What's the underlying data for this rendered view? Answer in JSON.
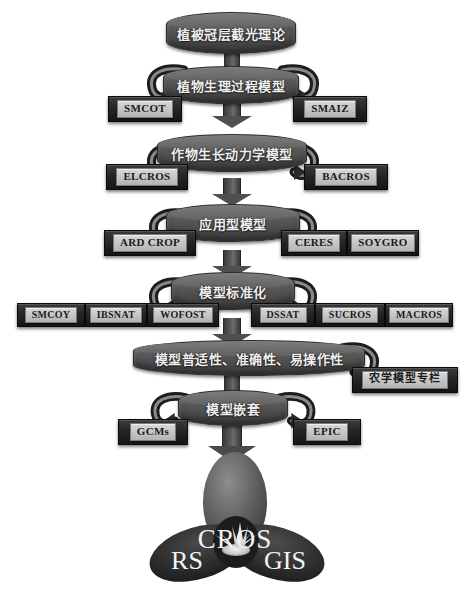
{
  "diagram": {
    "title_flow": "Crop model development flowchart",
    "background_color": "#ffffff",
    "node_color": "#5a5a5a",
    "box_color": "#1e1e1e",
    "label_text_color": "#1b1b1b"
  },
  "levels": [
    {
      "id": "level-1",
      "node": "植被冠层截光理论",
      "left_boxes": [],
      "right_boxes": []
    },
    {
      "id": "level-2",
      "node": "植物生理过程模型",
      "left_boxes": [
        "SMCOT"
      ],
      "right_boxes": [
        "SMAIZ"
      ]
    },
    {
      "id": "level-3",
      "node": "作物生长动力学模型",
      "left_boxes": [
        "ELCROS"
      ],
      "right_boxes": [
        "BACROS"
      ]
    },
    {
      "id": "level-4",
      "node": "应用型模型",
      "left_boxes": [
        "ARD CROP"
      ],
      "right_boxes": [
        "CERES",
        "SOYGRO"
      ]
    },
    {
      "id": "level-5",
      "node": "模型标准化",
      "left_boxes": [
        "SMCOY",
        "IBSNAT",
        "WOFOST"
      ],
      "right_boxes": [
        "DSSAT",
        "SUCROS",
        "MACROS"
      ]
    },
    {
      "id": "level-6",
      "node": "模型普适性、准确性、易操作性",
      "left_boxes": [],
      "right_boxes": [
        "农学模型专栏"
      ]
    },
    {
      "id": "level-7",
      "node": "模型嵌套",
      "left_boxes": [
        "GCMs"
      ],
      "right_boxes": [
        "EPIC"
      ]
    }
  ],
  "logo": {
    "top_label": "CROS",
    "left_label": "RS",
    "right_label": "GIS"
  }
}
